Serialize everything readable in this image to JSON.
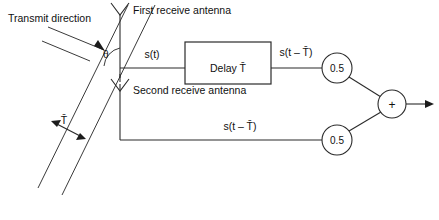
{
  "diagram": {
    "labels": {
      "transmit_direction": "Transmit direction",
      "first_antenna": "First receive antenna",
      "second_antenna": "Second receive antenna",
      "theta": "θ",
      "spacing_delay": "T̄",
      "signal_top": "s(t)",
      "delay_block": "Delay T̄",
      "delayed_signal_top": "s(t – T̄)",
      "delayed_signal_bottom": "s(t – T̄)",
      "gain_top": "0.5",
      "gain_bottom": "0.5",
      "summer": "+"
    },
    "colors": {
      "background": "#ffffff",
      "line": "#2b2b2b",
      "text": "#101010",
      "arrowhead": "#1c1c1c"
    }
  }
}
